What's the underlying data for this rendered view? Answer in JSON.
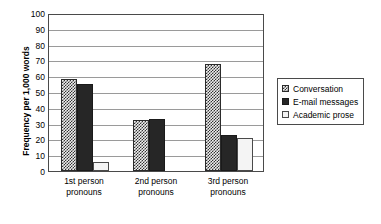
{
  "chart_data": {
    "type": "bar",
    "title": "",
    "subtitle": "",
    "xlabel": "",
    "ylabel": "Frequency per 1,000 words",
    "ylim": [
      0,
      100
    ],
    "ytick_step": 10,
    "yticks": [
      "0",
      "10",
      "20",
      "30",
      "40",
      "50",
      "60",
      "70",
      "80",
      "90",
      "100"
    ],
    "grid": true,
    "legend_position": "right",
    "categories": [
      "1st person pronouns",
      "2nd person pronouns",
      "3rd person pronouns"
    ],
    "category_lines": [
      {
        "line1": "1st person",
        "line2": "pronouns"
      },
      {
        "line1": "2nd person",
        "line2": "pronouns"
      },
      {
        "line1": "3rd person",
        "line2": "pronouns"
      }
    ],
    "series": [
      {
        "name": "Conversation",
        "values": [
          58,
          32,
          68
        ],
        "pattern": "checkered",
        "color": "#333333"
      },
      {
        "name": "E-mail messages",
        "values": [
          55,
          33,
          23
        ],
        "pattern": "solid",
        "color": "#262626"
      },
      {
        "name": "Academic prose",
        "values": [
          6,
          0,
          21
        ],
        "pattern": "empty",
        "color": "#f4f4f4"
      }
    ]
  },
  "legend": {
    "items": [
      {
        "label": "Conversation",
        "swatch": "checkered-swatch-icon"
      },
      {
        "label": "E-mail messages",
        "swatch": "solid-swatch-icon"
      },
      {
        "label": "Academic prose",
        "swatch": "empty-swatch-icon"
      }
    ]
  }
}
